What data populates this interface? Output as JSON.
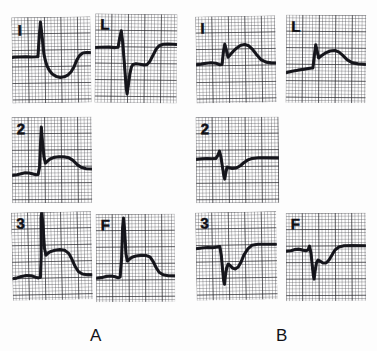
{
  "figure": {
    "background_color": "#fdfdfd",
    "trace_color": "#14141a",
    "grid_color": "#46464c",
    "grid_bold_color": "#28282c"
  },
  "groups": [
    {
      "id": "A",
      "label": "A",
      "panels": [
        {
          "id": "a-lead-1",
          "lead_label": "I",
          "lead_name": "lead-I",
          "position": {
            "x": 12,
            "y": 17,
            "w": 79,
            "h": 86
          },
          "rotation": -0.8,
          "label_pos": {
            "x": 6,
            "y": 5
          },
          "baseline_pct": 46,
          "morphology": "small q, tall sharp R, deep ST depression with inverted-then-upright T",
          "path": "M0,40 L2,39.6 L14,39.4 L20,39.8 L24,39.6 L26,39.4 L27.5,20 L29,5 L30.5,20 L32,37 L33.5,44 L35,49 L37,53 L40,57 L44,59.5 L48,60.5 L52,60 L56,58 L59,55 L62,50 L65,43 L68,38.5 L71,36.5 L75,36 L79,36.2"
        },
        {
          "id": "a-lead-avl",
          "lead_label": "L",
          "lead_name": "lead-aVL",
          "position": {
            "x": 95,
            "y": 14,
            "w": 82,
            "h": 89
          },
          "rotation": 0.6,
          "label_pos": {
            "x": 5,
            "y": 3
          },
          "baseline_pct": 40,
          "morphology": "tall R followed by very deep S, ST depression, slow upstroke to elevated T plateau",
          "path": "M0,34 L5,33.6 L14,33.4 L20,33.8 L23,33.4 L24.5,24 L26,17 L27.5,28 L29,45 L30.5,62 L31.5,74 L32.5,80 L33.5,72 L35,60 L36.5,53 L38,50.5 L41,49.8 L45,50.2 L49,51 L52,50.6 L55,47 L58,41 L61,35 L64,31.5 L68,30 L73,29.6 L78,29.8 L82,30"
        },
        {
          "id": "a-lead-2",
          "lead_label": "2",
          "lead_name": "lead-II",
          "position": {
            "x": 12,
            "y": 117,
            "w": 80,
            "h": 86
          },
          "rotation": -0.5,
          "label_pos": {
            "x": 5,
            "y": 4
          },
          "baseline_pct": 62,
          "morphology": "very tall peaked R wave, small q, coved elevated ST-T plateau",
          "path": "M0,58 L5,57.4 L9,56.4 L13,55.6 L17,55.8 L21,56.8 L24,57.6 L26,57.4 L27.5,50 L28.6,28 L29.6,10 L30.6,24 L32,40 L33.4,46 L35,44.6 L38,42 L42,40.4 L47,39.8 L52,40 L57,41 L61,43.6 L65,47.6 L69,50.6 L74,52 L80,52.4"
        },
        {
          "id": "a-lead-3",
          "lead_label": "3",
          "lead_name": "lead-III",
          "position": {
            "x": 12,
            "y": 212,
            "w": 80,
            "h": 88
          },
          "rotation": -1.2,
          "label_pos": {
            "x": 5,
            "y": 3
          },
          "baseline_pct": 70,
          "morphology": "towering R wave off the top of panel, notched descending ST, T returns to baseline",
          "path": "M0,66 L4,65.4 L9,63.8 L14,63 L19,63.4 L23,64.8 L26,65.6 L28,65 L29.2,44 L29.8,6 L30.6,0 L31.4,10 L32.6,36 L34,43 L36,41 L39,39.4 L43,38.4 L48,37.8 L53,38.6 L57,42 L60,48 L63,55 L66,60 L70,62.6 L75,63.4 L80,63.6"
        },
        {
          "id": "a-lead-avf",
          "lead_label": "F",
          "lead_name": "lead-aVF",
          "position": {
            "x": 96,
            "y": 214,
            "w": 79,
            "h": 88
          },
          "rotation": -0.4,
          "label_pos": {
            "x": 5,
            "y": 3
          },
          "baseline_pct": 68,
          "morphology": "tall narrow spiked R, elevated coved ST segment plateau, T returns to baseline",
          "path": "M0,64 L5,63.4 L10,62.2 L15,61.8 L19,62.6 L22,63.6 L24,63 L25.6,44 L26.8,14 L27.8,4 L28.8,16 L30,40 L31.4,47 L33,45.4 L36,43.2 L40,42 L45,41.4 L50,41.6 L54,43 L57,47.4 L60,53.6 L63,58.4 L67,61 L72,62 L79,62.2"
        }
      ]
    },
    {
      "id": "B",
      "label": "B",
      "panels": [
        {
          "id": "b-lead-1",
          "lead_label": "I",
          "lead_name": "lead-I",
          "position": {
            "x": 196,
            "y": 16,
            "w": 80,
            "h": 87
          },
          "rotation": -0.9,
          "label_pos": {
            "x": 5,
            "y": 4
          },
          "baseline_pct": 52,
          "morphology": "small R, broad rounded elevated ST-T hump returning to baseline",
          "path": "M0,48 L5,47.6 L10,46.8 L15,46.4 L20,47 L24,48.6 L26,48.2 L27.5,36 L29,28 L30.5,34 L32,41 L34,39 L37,35.6 L41,32 L45,29.4 L49,28.6 L53,30 L57,34 L61,39.4 L65,44 L70,46.6 L75,47.4 L80,47.6"
        },
        {
          "id": "b-lead-avl",
          "lead_label": "L",
          "lead_name": "lead-aVL",
          "position": {
            "x": 286,
            "y": 15,
            "w": 80,
            "h": 88
          },
          "rotation": 0.5,
          "label_pos": {
            "x": 5,
            "y": 4
          },
          "baseline_pct": 58,
          "morphology": "upsloping baseline, modest R wave, rounded elevated ST-T wave tapering to baseline",
          "path": "M0,58 L6,56.6 L12,55.4 L18,54.4 L24,53.4 L27,53 L28.4,40 L29.6,30 L31,36 L32.6,43 L35,41 L39,38.2 L44,36 L49,35.4 L53,37 L57,40.4 L61,44.4 L66,47.4 L72,48.6 L80,49"
        },
        {
          "id": "b-lead-2",
          "lead_label": "2",
          "lead_name": "lead-II",
          "position": {
            "x": 196,
            "y": 117,
            "w": 83,
            "h": 86
          },
          "rotation": -0.5,
          "label_pos": {
            "x": 5,
            "y": 4
          },
          "baseline_pct": 48,
          "morphology": "rS complex with deep narrow S wave, ST depression then small upright T, flat baseline",
          "path": "M0,42 L5,41.6 L11,41.2 L16,41.6 L20,41.2 L22,38 L23.6,34 L25,40 L26.4,50 L27.6,58 L28.6,62 L29.6,56 L31,50 L33,50.6 L36,51.4 L40,51 L44,49 L48,45.6 L52,43 L56,41.6 L62,41 L70,41 L83,41.2"
        },
        {
          "id": "b-lead-3",
          "lead_label": "3",
          "lead_name": "lead-III",
          "position": {
            "x": 196,
            "y": 212,
            "w": 81,
            "h": 88
          },
          "rotation": -1.0,
          "label_pos": {
            "x": 5,
            "y": 3
          },
          "baseline_pct": 42,
          "morphology": "deep narrow QS wave, notched slow recovery with double hump, returns to baseline",
          "path": "M0,36 L6,35.4 L12,35 L17,35.4 L21,34.6 L24,34.2 L25.4,44 L26.4,58 L27.2,68 L28,72 L29,64 L30.4,56 L32,52 L34,53.4 L36.4,56 L39,57 L42,55 L45,50 L48,43 L52,37 L56,33.6 L62,32.6 L70,32.8 L81,33"
        },
        {
          "id": "b-lead-avf",
          "lead_label": "F",
          "lead_name": "lead-aVF",
          "position": {
            "x": 286,
            "y": 213,
            "w": 80,
            "h": 88
          },
          "rotation": -0.3,
          "label_pos": {
            "x": 5,
            "y": 3
          },
          "baseline_pct": 44,
          "morphology": "small r then deep S, slurred notched ST recovery with small hump, returns to baseline",
          "path": "M0,38 L5,37.6 L9,36.4 L13,36 L17,37 L20,37.6 L22,36.8 L23.6,33 L25,40 L26.2,52 L27.2,62 L28,66 L29,58 L30.4,50 L32,47 L34.4,48.4 L37,50 L40,50 L43,47 L46,42 L49,37 L53,34 L58,32.8 L66,32.8 L80,33"
        }
      ]
    }
  ]
}
